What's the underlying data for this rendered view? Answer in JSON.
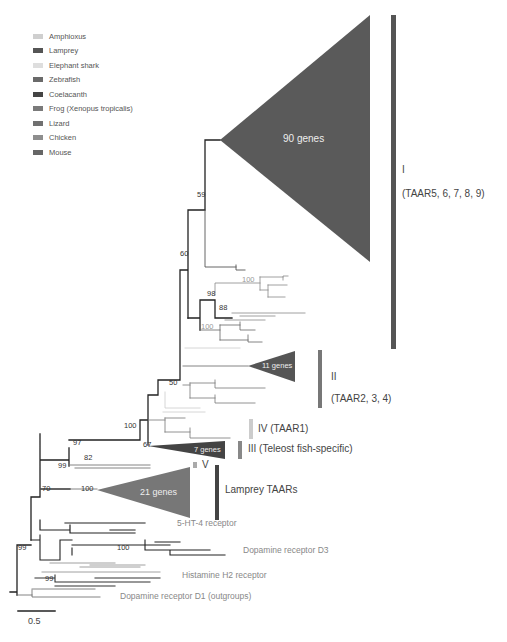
{
  "legend": {
    "items": [
      {
        "label": "Amphioxus",
        "color": "#cfcfcf"
      },
      {
        "label": "Lamprey",
        "color": "#555555"
      },
      {
        "label": "Elephant shark",
        "color": "#dedede"
      },
      {
        "label": "Zebrafish",
        "color": "#6a6a6a"
      },
      {
        "label": "Coelacanth",
        "color": "#444444"
      },
      {
        "label": "Frog (Xenopus tropicalis)",
        "color": "#7a7a7a"
      },
      {
        "label": "Lizard",
        "color": "#707070"
      },
      {
        "label": "Chicken",
        "color": "#8e8e8e"
      },
      {
        "label": "Mouse",
        "color": "#666666"
      }
    ]
  },
  "clades": {
    "I": {
      "numeral": "I",
      "desc": "(TAAR5, 6, 7, 8, 9)",
      "genes": "90 genes"
    },
    "II": {
      "numeral": "II",
      "desc": "(TAAR2, 3, 4)",
      "genes": "11 genes"
    },
    "III": {
      "label": "III  (Teleost fish-specific)",
      "genes": "7 genes"
    },
    "IV": {
      "label": "IV (TAAR1)"
    },
    "V": {
      "label": "V"
    },
    "lamprey": {
      "label": "Lamprey TAARs",
      "genes": "21 genes"
    }
  },
  "outgroups": {
    "ht4": "5-HT-4 receptor",
    "d3": "Dopamine receptor D3",
    "h2": "Histamine H2 receptor",
    "d1": "Dopamine receptor D1 (outgroups)"
  },
  "bootstrap": {
    "b59": "59",
    "b60": "60",
    "b100a": "100",
    "b98": "98",
    "b88": "88",
    "b100b": "100",
    "b50": "50",
    "b100c": "100",
    "b67": "67",
    "b97": "97",
    "b82": "82",
    "b99a": "99",
    "b100d": "100",
    "b70": "70",
    "b99b": "99",
    "b100e": "100",
    "b99c": "99"
  },
  "scale": {
    "label": "0.5"
  }
}
